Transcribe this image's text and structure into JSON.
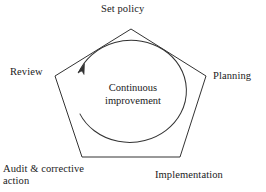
{
  "diagram": {
    "type": "pentagon-cycle",
    "shape_name": "pentagon",
    "direction": "clockwise",
    "colors": {
      "background": "#ffffff",
      "stroke": "#333333",
      "text": "#1a1a1a"
    },
    "center": {
      "line1": "Continuous",
      "line2": "improvement"
    },
    "nodes": [
      {
        "id": "set-policy",
        "label": "Set policy",
        "position": "top"
      },
      {
        "id": "planning",
        "label": "Planning",
        "position": "right"
      },
      {
        "id": "implementation",
        "label": "Implementation",
        "position": "bottom-right"
      },
      {
        "id": "audit",
        "label_line1": "Audit & corrective",
        "label_line2": "action",
        "position": "bottom-left"
      },
      {
        "id": "review",
        "label": "Review",
        "position": "left"
      }
    ],
    "arrow": {
      "name": "clockwise-arrow",
      "description": "arrowhead on inner circle pointing up-right"
    }
  }
}
